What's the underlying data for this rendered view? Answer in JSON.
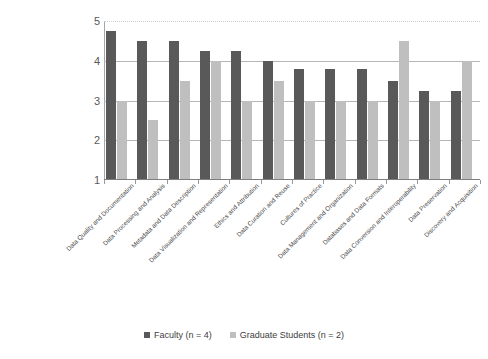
{
  "chart_data": {
    "type": "bar",
    "title": "",
    "subtitle": "",
    "xlabel": "",
    "ylabel": "",
    "ylim": [
      1,
      5
    ],
    "yticks": [
      1,
      2,
      3,
      4,
      5
    ],
    "ytick_labels": [
      "1",
      "2",
      "3",
      "4",
      "5"
    ],
    "grid": true,
    "grid_axis": "y",
    "legend_position": "bottom-center",
    "categories": [
      "Data Quality and Documentation",
      "Data Processing and Analysis",
      "Metadata and Data Description",
      "Data Visualization and Representation",
      "Ethics and Attribution",
      "Data Curation and Reuse",
      "Cultures of Practice",
      "Data Management and Organization",
      "Databases and Data Formats",
      "Data Conversion and Interoperability",
      "Data Preservation",
      "Discovery and Acquisition"
    ],
    "series": [
      {
        "name": "Faculty (n = 4)",
        "color": "#595959",
        "values": [
          4.75,
          4.5,
          4.5,
          4.25,
          4.25,
          4.0,
          3.8,
          3.8,
          3.8,
          3.5,
          3.25,
          3.25
        ]
      },
      {
        "name": "Graduate Students (n = 2)",
        "color": "#bfbfbf",
        "values": [
          3.0,
          2.5,
          3.5,
          4.0,
          3.0,
          3.5,
          3.0,
          3.0,
          3.0,
          4.5,
          3.0,
          4.0
        ]
      }
    ]
  },
  "legend": {
    "items": [
      {
        "label": "Faculty (n = 4)",
        "swatch": "faculty"
      },
      {
        "label": "Graduate Students (n = 2)",
        "swatch": "grad"
      }
    ]
  },
  "colors": {
    "faculty": "#595959",
    "graduate": "#bfbfbf",
    "gridline": "#b6b6b6",
    "axis": "#7f7f7f",
    "text": "#404040"
  }
}
